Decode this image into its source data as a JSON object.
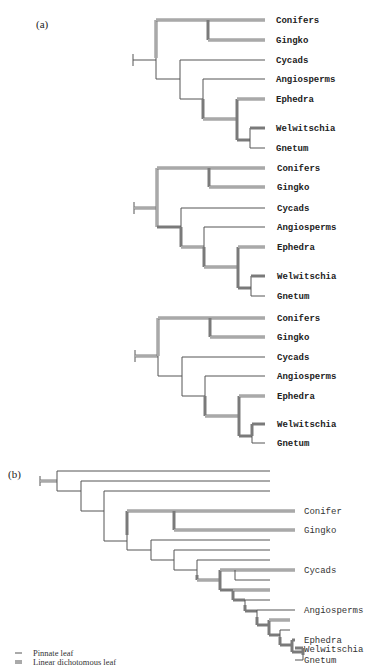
{
  "panel_a": {
    "label": "(a)",
    "trees": [
      {
        "taxa": [
          "Conifers",
          "Gingko",
          "Cycads",
          "Angiosperms",
          "Ephedra",
          "Welwitschia",
          "Gnetum"
        ]
      },
      {
        "taxa": [
          "Conifers",
          "Gingko",
          "Cycads",
          "Angiosperms",
          "Ephedra",
          "Welwitschia",
          "Gnetum"
        ]
      },
      {
        "taxa": [
          "Conifers",
          "Gingko",
          "Cycads",
          "Angiosperms",
          "Ephedra",
          "Welwitschia",
          "Gnetum"
        ]
      }
    ]
  },
  "panel_b": {
    "label": "(b)",
    "taxa": [
      "Conifer",
      "Gingko",
      "Cycads",
      "Angiosperms",
      "Ephedra",
      "Welwitschia",
      "Gnetum"
    ]
  },
  "legend": {
    "items": [
      {
        "symbol": "—",
        "label": "Pinnate leaf"
      },
      {
        "symbol": "=",
        "label": "Linear dichotomous leaf"
      }
    ]
  },
  "colors": {
    "thin_line": "#555555",
    "double_line": "#7a7a7a",
    "text": "#222222"
  }
}
